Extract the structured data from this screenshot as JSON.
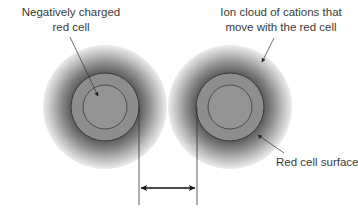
{
  "labels": {
    "negative_cell": [
      "Negatively charged",
      "red cell"
    ],
    "ion_cloud": [
      "Ion cloud of cations that",
      "move with the red cell"
    ],
    "surface": "Red cell surface"
  },
  "colors": {
    "cell_fill": "#8c8c8c",
    "halo_dark": "#5a5a5a",
    "halo_light": "#f2f2f2",
    "line": "#222222",
    "text": "#3a3a3a"
  }
}
